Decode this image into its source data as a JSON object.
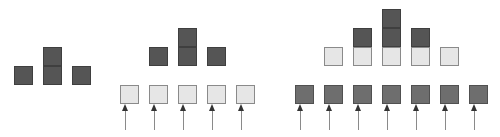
{
  "diagram": {
    "colors": {
      "dark": "#555555",
      "medium": "#6e6e6e",
      "light": "#e6e6e6",
      "border": "#8a8a8a",
      "arrow": "#8a8a8a"
    },
    "groups": [
      {
        "name": "group-1",
        "squares": [
          {
            "x": 14,
            "y": 66,
            "tone": "dark"
          },
          {
            "x": 43,
            "y": 47,
            "tone": "dark"
          },
          {
            "x": 43,
            "y": 66,
            "tone": "dark"
          },
          {
            "x": 72,
            "y": 66,
            "tone": "dark"
          }
        ],
        "arrows": []
      },
      {
        "name": "group-2",
        "squares": [
          {
            "x": 149,
            "y": 47,
            "tone": "dark"
          },
          {
            "x": 178,
            "y": 28,
            "tone": "dark"
          },
          {
            "x": 178,
            "y": 47,
            "tone": "dark"
          },
          {
            "x": 207,
            "y": 47,
            "tone": "dark"
          },
          {
            "x": 120,
            "y": 85,
            "tone": "light"
          },
          {
            "x": 149,
            "y": 85,
            "tone": "light"
          },
          {
            "x": 178,
            "y": 85,
            "tone": "light"
          },
          {
            "x": 207,
            "y": 85,
            "tone": "light"
          },
          {
            "x": 236,
            "y": 85,
            "tone": "light"
          }
        ],
        "arrows": [
          {
            "x": 125,
            "y1": 104,
            "y2": 130
          },
          {
            "x": 154,
            "y1": 104,
            "y2": 130
          },
          {
            "x": 183,
            "y1": 104,
            "y2": 130
          },
          {
            "x": 212,
            "y1": 104,
            "y2": 130
          },
          {
            "x": 241,
            "y1": 104,
            "y2": 130
          }
        ]
      },
      {
        "name": "group-3",
        "squares": [
          {
            "x": 382,
            "y": 9,
            "tone": "dark"
          },
          {
            "x": 353,
            "y": 28,
            "tone": "dark"
          },
          {
            "x": 382,
            "y": 28,
            "tone": "dark"
          },
          {
            "x": 411,
            "y": 28,
            "tone": "dark"
          },
          {
            "x": 324,
            "y": 47,
            "tone": "light"
          },
          {
            "x": 353,
            "y": 47,
            "tone": "light"
          },
          {
            "x": 382,
            "y": 47,
            "tone": "light"
          },
          {
            "x": 411,
            "y": 47,
            "tone": "light"
          },
          {
            "x": 440,
            "y": 47,
            "tone": "light"
          },
          {
            "x": 295,
            "y": 85,
            "tone": "med"
          },
          {
            "x": 324,
            "y": 85,
            "tone": "med"
          },
          {
            "x": 353,
            "y": 85,
            "tone": "med"
          },
          {
            "x": 382,
            "y": 85,
            "tone": "med"
          },
          {
            "x": 411,
            "y": 85,
            "tone": "med"
          },
          {
            "x": 440,
            "y": 85,
            "tone": "med"
          },
          {
            "x": 469,
            "y": 85,
            "tone": "med"
          }
        ],
        "arrows": [
          {
            "x": 300,
            "y1": 104,
            "y2": 130
          },
          {
            "x": 329,
            "y1": 104,
            "y2": 130
          },
          {
            "x": 358,
            "y1": 104,
            "y2": 130
          },
          {
            "x": 387,
            "y1": 104,
            "y2": 130
          },
          {
            "x": 416,
            "y1": 104,
            "y2": 130
          },
          {
            "x": 445,
            "y1": 104,
            "y2": 130
          },
          {
            "x": 474,
            "y1": 104,
            "y2": 130
          }
        ]
      }
    ]
  }
}
